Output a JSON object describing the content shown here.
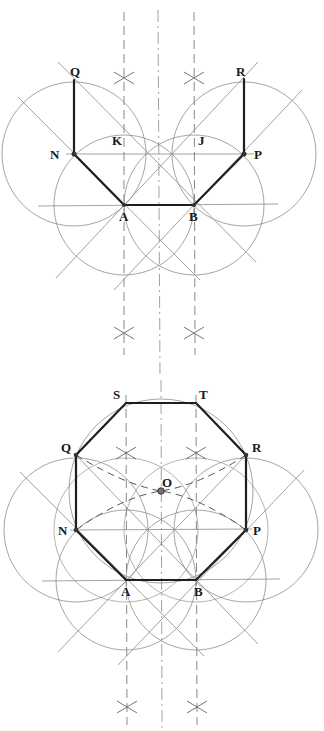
{
  "diagram": {
    "colors": {
      "background": "#ffffff",
      "construction": "#8a8a8a",
      "outline": "#1e1e1e"
    },
    "top_figure": {
      "name": "Step: half-octagon construction",
      "labels": {
        "Q": "Q",
        "R": "R",
        "N": "N",
        "P": "P",
        "K": "K",
        "J": "J",
        "A": "A",
        "B": "B"
      }
    },
    "bottom_figure": {
      "name": "Step: completed octagon with centre O",
      "labels": {
        "S": "S",
        "T": "T",
        "Q": "Q",
        "R": "R",
        "O": "O",
        "N": "N",
        "P": "P",
        "A": "A",
        "B": "B"
      }
    }
  }
}
